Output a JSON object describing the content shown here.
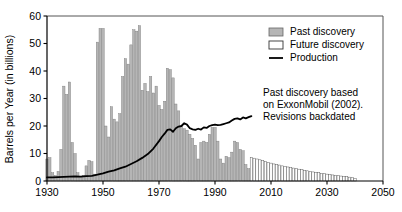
{
  "chart_data": {
    "type": "bar",
    "title": "",
    "xlabel": "",
    "ylabel": "Barrels per Year (in billions)",
    "xlim": [
      1930,
      2050
    ],
    "ylim": [
      0,
      60
    ],
    "xticks": [
      1930,
      1950,
      1970,
      1990,
      2010,
      2030,
      2050
    ],
    "yticks": [
      0,
      10,
      20,
      30,
      40,
      50,
      60
    ],
    "grid": false,
    "legend_position": "top-right",
    "legend": [
      {
        "label": "Past discovery",
        "marker": "filled-box",
        "color": "#b5b5b5"
      },
      {
        "label": "Future discovery",
        "marker": "hollow-box",
        "color": "#ffffff"
      },
      {
        "label": "Production",
        "marker": "line",
        "color": "#000000"
      }
    ],
    "annotations": [
      {
        "lines": [
          "Past discovery based",
          "on ExxonMobil (2002).",
          "Revisions backdated"
        ],
        "x": 2008,
        "y": 29
      }
    ],
    "series": [
      {
        "name": "Past discovery",
        "type": "bar",
        "color": "#b5b5b5",
        "x": [
          1930,
          1931,
          1932,
          1933,
          1934,
          1935,
          1936,
          1937,
          1938,
          1939,
          1940,
          1941,
          1942,
          1943,
          1944,
          1945,
          1946,
          1947,
          1948,
          1949,
          1950,
          1951,
          1952,
          1953,
          1954,
          1955,
          1956,
          1957,
          1958,
          1959,
          1960,
          1961,
          1962,
          1963,
          1964,
          1965,
          1966,
          1967,
          1968,
          1969,
          1970,
          1971,
          1972,
          1973,
          1974,
          1975,
          1976,
          1977,
          1978,
          1979,
          1980,
          1981,
          1982,
          1983,
          1984,
          1985,
          1986,
          1987,
          1988,
          1989,
          1990,
          1991,
          1992,
          1993,
          1994,
          1995,
          1996,
          1997,
          1998,
          1999,
          2000,
          2001,
          2002
        ],
        "values": [
          8.0,
          8.5,
          3.0,
          2.0,
          3.5,
          11.5,
          34.5,
          31.5,
          36.0,
          14.0,
          10.0,
          3.0,
          1.5,
          2.0,
          5.5,
          7.5,
          7.0,
          2.5,
          50.5,
          55.5,
          55.5,
          20.0,
          16.0,
          27.0,
          22.5,
          21.5,
          24.5,
          38.0,
          44.5,
          42.5,
          49.5,
          55.0,
          54.5,
          56.5,
          33.0,
          35.5,
          32.5,
          38.0,
          32.0,
          34.5,
          27.5,
          26.0,
          29.0,
          41.0,
          40.5,
          37.5,
          28.0,
          25.5,
          20.0,
          19.0,
          18.5,
          17.0,
          15.5,
          13.0,
          8.0,
          14.0,
          14.5,
          14.0,
          17.0,
          19.5,
          19.5,
          14.5,
          8.0,
          6.5,
          9.0,
          8.5,
          10.5,
          14.5,
          14.0,
          11.5,
          11.0,
          6.0,
          4.5
        ]
      },
      {
        "name": "Future discovery",
        "type": "bar",
        "color": "#ffffff",
        "x": [
          2003,
          2004,
          2005,
          2006,
          2007,
          2008,
          2009,
          2010,
          2011,
          2012,
          2013,
          2014,
          2015,
          2016,
          2017,
          2018,
          2019,
          2020,
          2021,
          2022,
          2023,
          2024,
          2025,
          2026,
          2027,
          2028,
          2029,
          2030,
          2031,
          2032,
          2033,
          2034,
          2035,
          2036,
          2037,
          2038,
          2039,
          2040
        ],
        "values": [
          8.5,
          8.3,
          8.0,
          7.7,
          7.4,
          7.1,
          6.8,
          6.5,
          6.2,
          6.0,
          5.8,
          5.5,
          5.3,
          5.1,
          4.9,
          4.7,
          4.5,
          4.3,
          4.1,
          3.9,
          3.7,
          3.5,
          3.3,
          3.1,
          3.0,
          2.8,
          2.7,
          2.5,
          2.4,
          2.2,
          2.1,
          2.0,
          1.8,
          1.7,
          1.6,
          1.4,
          1.3,
          1.0
        ]
      },
      {
        "name": "Production",
        "type": "line",
        "color": "#000000",
        "x": [
          1930,
          1932,
          1934,
          1936,
          1938,
          1940,
          1942,
          1944,
          1946,
          1948,
          1950,
          1952,
          1954,
          1956,
          1958,
          1960,
          1962,
          1964,
          1966,
          1968,
          1970,
          1971,
          1972,
          1973,
          1974,
          1975,
          1976,
          1977,
          1978,
          1979,
          1980,
          1981,
          1982,
          1983,
          1984,
          1985,
          1986,
          1987,
          1988,
          1989,
          1990,
          1991,
          1992,
          1993,
          1994,
          1995,
          1996,
          1997,
          1998,
          1999,
          2000,
          2001,
          2002,
          2003
        ],
        "values": [
          1.3,
          1.3,
          1.4,
          1.5,
          1.6,
          1.7,
          1.6,
          1.8,
          1.9,
          2.3,
          2.8,
          3.4,
          3.9,
          4.6,
          5.2,
          6.2,
          7.2,
          8.4,
          9.8,
          11.8,
          14.5,
          16.0,
          17.2,
          18.6,
          18.8,
          17.9,
          19.2,
          19.8,
          20.0,
          21.0,
          20.5,
          19.2,
          18.8,
          18.6,
          19.0,
          18.7,
          19.5,
          19.3,
          20.0,
          20.3,
          20.5,
          20.3,
          20.4,
          20.7,
          21.0,
          21.3,
          22.0,
          22.6,
          22.8,
          22.4,
          23.1,
          22.8,
          23.2,
          23.6
        ]
      }
    ]
  }
}
